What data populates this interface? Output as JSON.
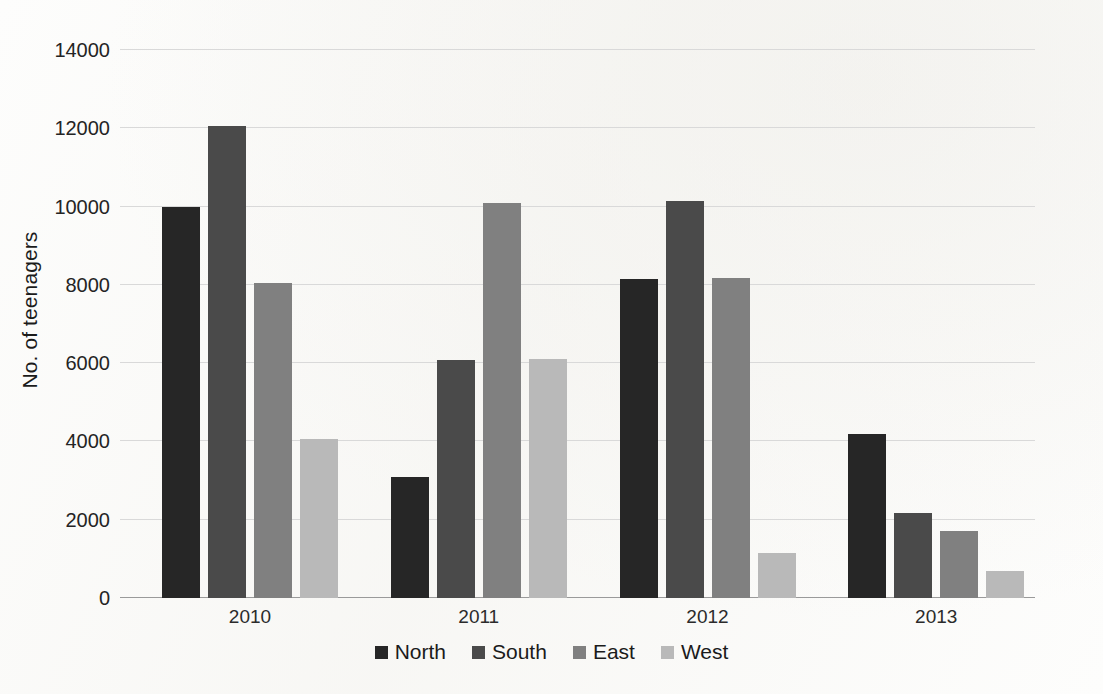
{
  "chart_data": {
    "type": "bar",
    "title": "",
    "xlabel": "",
    "ylabel": "No. of teenagers",
    "categories": [
      "2010",
      "2011",
      "2012",
      "2013"
    ],
    "series": [
      {
        "name": "North",
        "color": "#262626",
        "values": [
          10000,
          3080,
          8150,
          4180
        ]
      },
      {
        "name": "South",
        "color": "#4a4a4a",
        "values": [
          12050,
          6080,
          10150,
          2180
        ]
      },
      {
        "name": "East",
        "color": "#808080",
        "values": [
          8050,
          10100,
          8180,
          1720
        ]
      },
      {
        "name": "West",
        "color": "#b9b9b9",
        "values": [
          4050,
          6100,
          1150,
          700
        ]
      }
    ],
    "ylim": [
      0,
      14000
    ],
    "ytick_values": [
      0,
      2000,
      4000,
      6000,
      8000,
      10000,
      12000,
      14000
    ],
    "ytick_labels": [
      "0",
      "2000",
      "4000",
      "6000",
      "8000",
      "10000",
      "12000",
      "14000"
    ],
    "grid": true,
    "legend_position": "bottom"
  },
  "axis": {
    "y_title": "No. of teenagers"
  }
}
